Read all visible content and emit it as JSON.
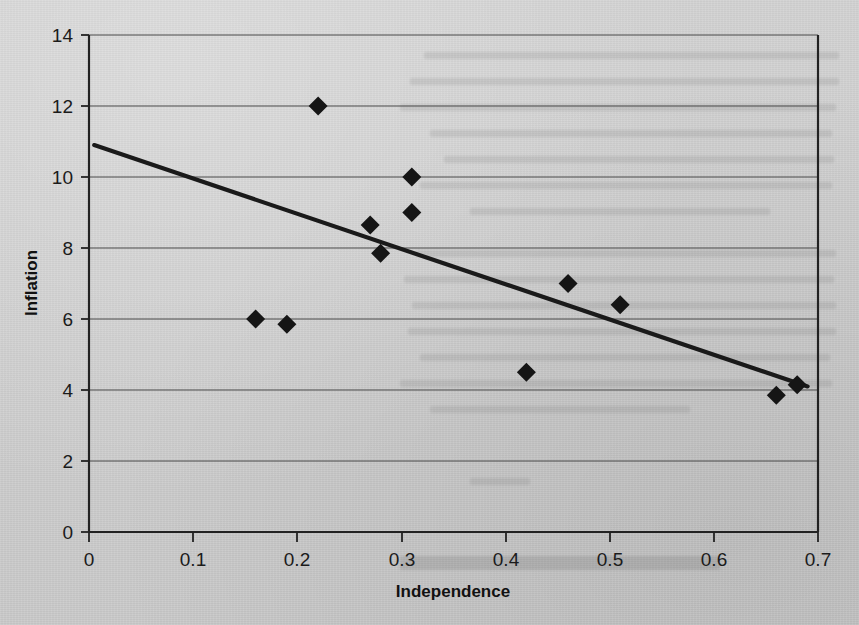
{
  "figure": {
    "background_color": "#cfcfcf",
    "ink_color": "#151515"
  },
  "chart_data": {
    "type": "scatter",
    "title": "",
    "xlabel": "Independence",
    "ylabel": "Inflation",
    "xlim": [
      0,
      0.7
    ],
    "ylim": [
      0,
      14
    ],
    "xticks": [
      "0",
      "0.1",
      "0.2",
      "0.3",
      "0.4",
      "0.5",
      "0.6",
      "0.7"
    ],
    "xtick_values": [
      0,
      0.1,
      0.2,
      0.3,
      0.4,
      0.5,
      0.6,
      0.7
    ],
    "yticks": [
      "0",
      "2",
      "4",
      "6",
      "8",
      "10",
      "12",
      "14"
    ],
    "ytick_values": [
      0,
      2,
      4,
      6,
      8,
      10,
      12,
      14
    ],
    "grid": "horizontal",
    "legend": "none",
    "marker": "diamond",
    "points": [
      {
        "x": 0.16,
        "y": 6.0
      },
      {
        "x": 0.19,
        "y": 5.85
      },
      {
        "x": 0.22,
        "y": 12.0
      },
      {
        "x": 0.27,
        "y": 8.65
      },
      {
        "x": 0.28,
        "y": 7.85
      },
      {
        "x": 0.31,
        "y": 10.0
      },
      {
        "x": 0.31,
        "y": 9.0
      },
      {
        "x": 0.42,
        "y": 4.5
      },
      {
        "x": 0.46,
        "y": 7.0
      },
      {
        "x": 0.51,
        "y": 6.4
      },
      {
        "x": 0.66,
        "y": 3.85
      },
      {
        "x": 0.68,
        "y": 4.15
      }
    ],
    "trendline": {
      "type": "linear-fit",
      "x_start": 0.005,
      "y_start": 10.9,
      "x_end": 0.69,
      "y_end": 4.1
    }
  }
}
